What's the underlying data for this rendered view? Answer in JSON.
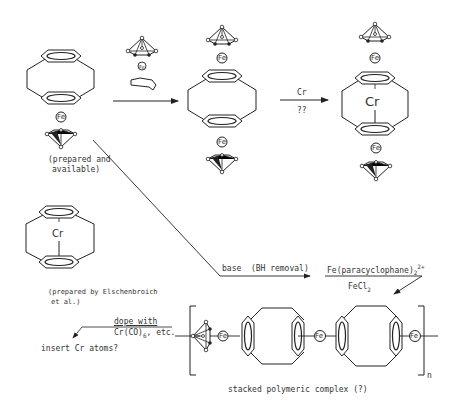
{
  "labels": {
    "fe": "Fe",
    "cr": "Cr",
    "fe_small": "Fe",
    "prepared_available_1": "(prepared and",
    "prepared_available_2": "available)",
    "reagent_cr": "Cr",
    "reagent_qq": "??",
    "elschenbroich_1": "(prepared by Elschenbroich",
    "elschenbroich_2": "et al.)",
    "base_bh": "base  (BH removal)",
    "fe_paracyclophane": "Fe(paracyclophane)",
    "fe_paracyclophane_sub": "2",
    "fe_paracyclophane_sup": "2+",
    "fecl2": "FeCl",
    "fecl2_sub": "2",
    "dope_with": "dope with",
    "cr_co6": "Cr(CO)",
    "cr_co6_sub": "6",
    "cr_co6_tail": ", etc.",
    "insert_cr": "insert Cr atoms?",
    "stacked_polymer": "stacked polymeric complex (?)",
    "n_subscript": "n"
  },
  "colors": {
    "ink": "#222222",
    "background": "#ffffff"
  }
}
